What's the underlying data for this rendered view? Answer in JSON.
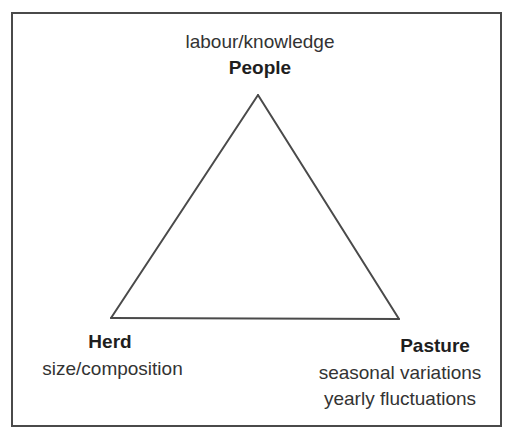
{
  "diagram": {
    "type": "triangle",
    "nodes": [
      {
        "id": "people",
        "title": "People",
        "subtitle_lines": [
          "labour/knowledge"
        ],
        "position": "top"
      },
      {
        "id": "herd",
        "title": "Herd",
        "subtitle_lines": [
          "size/composition"
        ],
        "position": "bottom-left"
      },
      {
        "id": "pasture",
        "title": "Pasture",
        "subtitle_lines": [
          "seasonal variations",
          "yearly fluctuations"
        ],
        "position": "bottom-right"
      }
    ],
    "edges": [
      {
        "from": "people",
        "to": "herd"
      },
      {
        "from": "herd",
        "to": "pasture"
      },
      {
        "from": "pasture",
        "to": "people"
      }
    ]
  },
  "colors": {
    "stroke": "#4a4a4a",
    "text": "#2a2a2a"
  }
}
